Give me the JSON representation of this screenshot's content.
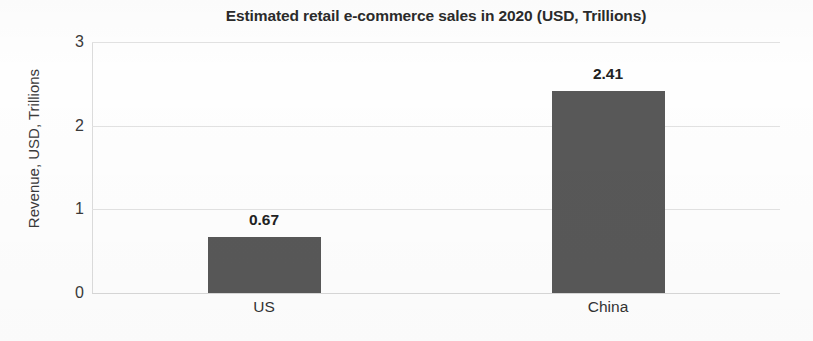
{
  "chart_data": {
    "type": "bar",
    "title": "Estimated retail e-commerce sales in 2020 (USD, Trillions)",
    "xlabel": "",
    "ylabel": "Revenue, USD, Trillions",
    "categories": [
      "US",
      "China"
    ],
    "values": [
      0.67,
      2.41
    ],
    "value_labels": [
      "0.67",
      "2.41"
    ],
    "ylim": [
      0,
      3
    ],
    "yticks": [
      0,
      1,
      2,
      3
    ],
    "ytick_labels": [
      "0",
      "1",
      "2",
      "3"
    ],
    "grid": true,
    "legend": false,
    "legend_position": "none",
    "series": [
      {
        "name": "Revenue",
        "values": [
          0.67,
          2.41
        ]
      }
    ],
    "colors": {
      "bar_fill": "#585858",
      "gridline": "#e2e2e2",
      "axis": "#dcdcdc",
      "text": "#2b2b2b",
      "background": "#fefefe"
    }
  }
}
